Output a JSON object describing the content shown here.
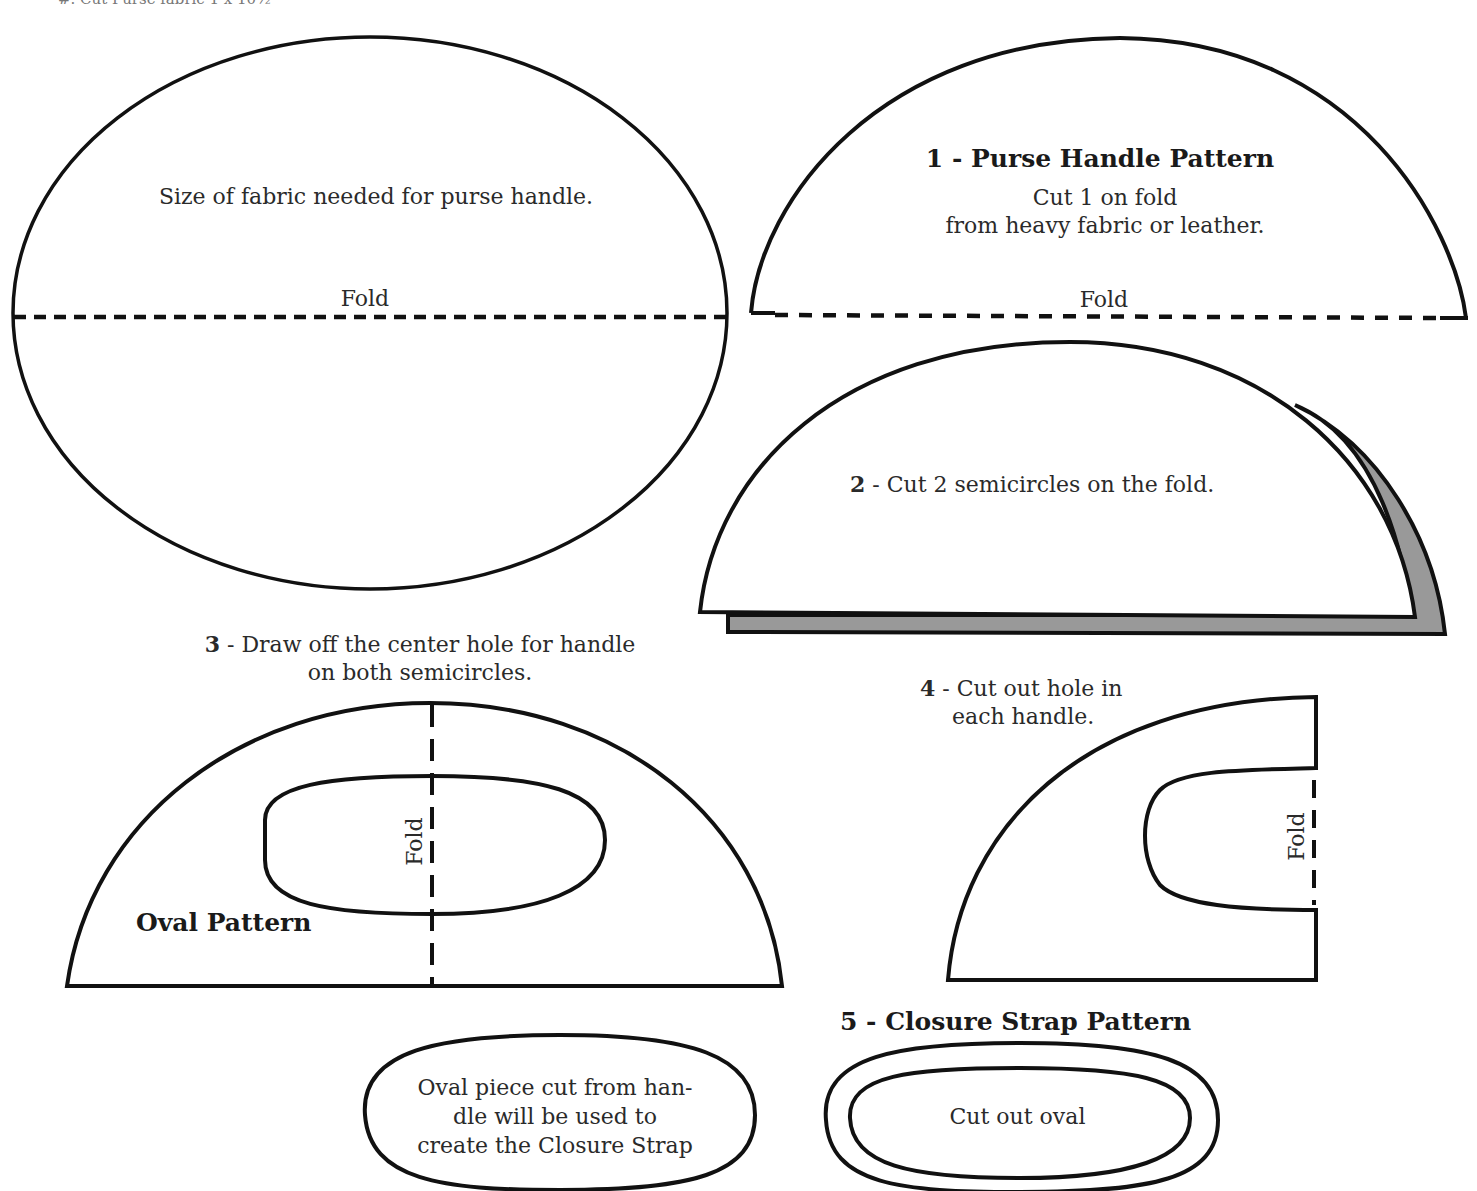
{
  "page": {
    "header_cut": "#. Cut Purse fabric 1 x 10½\""
  },
  "step0": {
    "text": "Size of fabric needed for purse handle.",
    "fold": "Fold"
  },
  "step1": {
    "title": "1 - Purse Handle Pattern",
    "line1": "Cut 1 on fold",
    "line2": "from heavy fabric or leather.",
    "fold": "Fold"
  },
  "step2": {
    "num": "2",
    "text": " - Cut 2 semicircles on the fold."
  },
  "step3": {
    "num": "3",
    "line1": " - Draw off the center hole for handle",
    "line2": "on both semicircles.",
    "fold": "Fold",
    "oval_label": "Oval Pattern"
  },
  "step4": {
    "num": "4",
    "line1": " - Cut out hole in",
    "line2": "each handle.",
    "fold": "Fold"
  },
  "oval_piece": {
    "line1": "Oval piece cut from han-",
    "line2": "dle will be used to",
    "line3": "create the Closure Strap"
  },
  "step5": {
    "title": "5 - Closure Strap Pattern",
    "text": "Cut out oval"
  },
  "colors": {
    "stroke": "#111111",
    "shadow": "#999999",
    "paper": "#ffffff"
  }
}
